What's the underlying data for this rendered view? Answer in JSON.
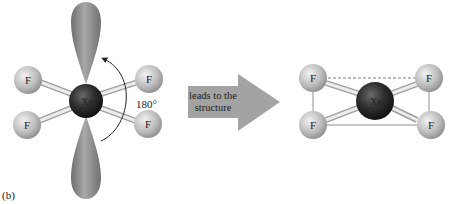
{
  "figure": {
    "panel_label": "(b)",
    "left_molecule": {
      "central_atom": "Xe",
      "ligands": [
        "F",
        "F",
        "F",
        "F"
      ],
      "angle_label": "180°",
      "lone_pairs": 2
    },
    "arrow": {
      "line1": "leads to the",
      "line2": "structure"
    },
    "right_molecule": {
      "central_atom": "Xe",
      "ligands": [
        "F",
        "F",
        "F",
        "F"
      ]
    }
  },
  "colors": {
    "lobe": "#8a8a8a",
    "fluorine": "#c8c8c8",
    "xenon": "#2a2a2a",
    "arrow": "#a0a0a0"
  }
}
